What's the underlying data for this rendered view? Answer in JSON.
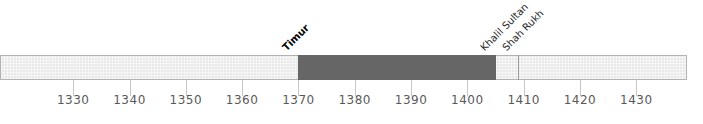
{
  "chart_data": {
    "type": "timeline",
    "axis": {
      "min": 1317,
      "max": 1439,
      "tick_interval": 10,
      "ticks": [
        1330,
        1340,
        1350,
        1360,
        1370,
        1380,
        1390,
        1400,
        1410,
        1420,
        1430
      ]
    },
    "segments": [
      {
        "start": 1317,
        "end": 1370,
        "style": "light"
      },
      {
        "start": 1370,
        "end": 1405,
        "style": "dark"
      },
      {
        "start": 1405,
        "end": 1439,
        "style": "light"
      }
    ],
    "events": [
      {
        "label": "Timur",
        "year": 1370,
        "emphasis": "bold"
      },
      {
        "label": "Khalil Sultan",
        "year": 1405,
        "emphasis": "normal"
      },
      {
        "label": "Shah Rukh",
        "year": 1409,
        "emphasis": "normal"
      }
    ],
    "divider_year": 1409,
    "colors": {
      "dark_segment": "#666666",
      "light_segment": "#e9e9e9",
      "bar_border": "#b2b2b2",
      "tick": "#c6c6c6",
      "tick_label": "#595959",
      "event_label": "#2b2b2b",
      "divider_line": "#9a9a9a",
      "background": "#ffffff"
    }
  }
}
